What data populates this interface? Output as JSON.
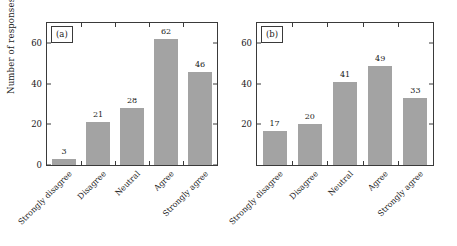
{
  "chart_data": [
    {
      "type": "bar",
      "panel_label": "(a)",
      "title": "",
      "xlabel": "",
      "ylabel": "Number of responses",
      "categories": [
        "Strongly disagree",
        "Disagree",
        "Neutral",
        "Agree",
        "Strongly agree"
      ],
      "values": [
        3,
        21,
        28,
        62,
        46
      ],
      "ylim": [
        0,
        70
      ],
      "yticks": [
        0,
        20,
        40,
        60
      ],
      "ytick_labels": [
        "0",
        "20",
        "40",
        "60"
      ],
      "grid": false,
      "legend": "none",
      "bar_color": "#a3a3a3"
    },
    {
      "type": "bar",
      "panel_label": "(b)",
      "title": "",
      "xlabel": "",
      "ylabel": "",
      "categories": [
        "Strongly disagree",
        "Disagree",
        "Neutral",
        "Agree",
        "Strongly agree"
      ],
      "values": [
        17,
        20,
        41,
        49,
        33
      ],
      "ylim": [
        0,
        70
      ],
      "yticks": [
        20,
        40,
        60
      ],
      "ytick_labels": [
        "20",
        "40",
        "60"
      ],
      "grid": false,
      "legend": "none",
      "bar_color": "#a3a3a3"
    }
  ]
}
